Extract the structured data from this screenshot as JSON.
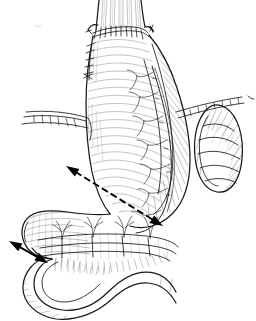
{
  "figure": {
    "title": "Surgical illustration: stomach, esophagogastric anastomosis, omentum and spleen",
    "type": "line-drawing",
    "style": "black-and-white pen-and-ink medical illustration",
    "background_color": "#ffffff",
    "ink_color": "#1a1a1a",
    "width": 256,
    "height": 321,
    "visible_text": "",
    "has_labels": false
  },
  "structures": [
    {
      "id": "esophagus",
      "name": "esophagus",
      "description": "tubular structure entering from top of image with longitudinal striations",
      "position": "top-center"
    },
    {
      "id": "anastomosis",
      "name": "esophagogastric-anastomosis-suture-line",
      "description": "row of interrupted suture marks across the junction of esophagus and gastric tube",
      "position": "upper-center"
    },
    {
      "id": "suture-row-left",
      "name": "lateral-suture-row",
      "description": "vertical column of interrupted sutures down the left border below the anastomosis",
      "position": "upper-left-of-center"
    },
    {
      "id": "stomach",
      "name": "stomach-gastric-tube",
      "description": "large vertically elongated gastric body with cross-hatch shading, lesser curvature at left and greater curvature at right",
      "position": "center"
    },
    {
      "id": "greater-curvature-arcade",
      "name": "gastroepiploic-vessel-arcade",
      "description": "vascular arcade running along the greater curvature with short branching vessels",
      "position": "center-right"
    },
    {
      "id": "antrum-pylorus",
      "name": "antrum-and-pylorus",
      "description": "lower curved portion of stomach sweeping to the left toward the duodenum",
      "position": "lower-left-of-center"
    },
    {
      "id": "omentum",
      "name": "greater-omentum-mesentery",
      "description": "horizontal banded mesenteric sheet below the stomach with branching arterial arcades and fine hatching",
      "position": "lower-center"
    },
    {
      "id": "duodenum-jejunum",
      "name": "duodenojejunal-bowel-loop",
      "description": "serpentine loop of small bowel crossing the bottom of the image",
      "position": "bottom"
    },
    {
      "id": "spleen",
      "name": "spleen",
      "description": "kidney-bean shaped segmented organ at the right margin",
      "position": "right"
    },
    {
      "id": "ligament-left",
      "name": "divided-ligament-left",
      "description": "narrow horizontal divided peritoneal band with cut edge entering from the left margin",
      "position": "mid-left"
    },
    {
      "id": "ligament-right",
      "name": "divided-ligament-right",
      "description": "narrow horizontal divided peritoneal band entering from the right margin toward the spleen",
      "position": "mid-right"
    }
  ],
  "annotations": {
    "arrows": [
      {
        "id": "arrow-diagonal",
        "name": "diagonal-dimension-arrow",
        "style": "dashed double-headed",
        "from": {
          "x": 66,
          "y": 166
        },
        "to": {
          "x": 163,
          "y": 226
        },
        "indicates": "oblique distance across the gastric body to the greater curvature"
      },
      {
        "id": "arrow-lower-left",
        "name": "lower-left-dimension-arrow",
        "style": "solid double-headed",
        "from": {
          "x": 9,
          "y": 241
        },
        "to": {
          "x": 48,
          "y": 263
        },
        "indicates": "short distance at the antral / duodenal margin"
      }
    ],
    "arrow_color": "#000000",
    "arrow_count": 2
  }
}
